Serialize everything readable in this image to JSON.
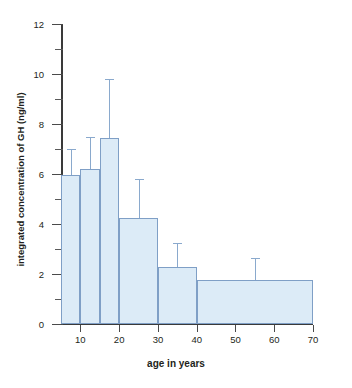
{
  "chart_data": {
    "type": "bar",
    "title": "",
    "xlabel": "age in years",
    "ylabel": "integrated concentration of GH (ng/ml)",
    "xlim": [
      5,
      70
    ],
    "ylim": [
      0,
      12
    ],
    "grid": false,
    "legend": null,
    "y_ticks": [
      0,
      2,
      4,
      6,
      8,
      10,
      12
    ],
    "y_tick_labels": [
      "0",
      "2",
      "4",
      "6",
      "8",
      "10",
      "12"
    ],
    "y_minor_ticks": [
      1,
      3,
      5,
      7,
      9,
      11
    ],
    "x_ticks": [
      10,
      20,
      30,
      40,
      50,
      60,
      70
    ],
    "x_tick_labels": [
      "10",
      "20",
      "30",
      "40",
      "50",
      "60",
      "70"
    ],
    "categories": [
      "5-10",
      "10-15",
      "15-20",
      "20-30",
      "30-40",
      "40-70"
    ],
    "values": [
      5.95,
      6.2,
      7.45,
      4.25,
      2.3,
      1.75
    ],
    "errors": [
      1.05,
      1.3,
      2.35,
      1.55,
      0.95,
      0.9
    ],
    "bars": [
      {
        "label": "5-10",
        "x_start": 5,
        "x_end": 10,
        "value": 5.95,
        "error_high": 7.0
      },
      {
        "label": "10-15",
        "x_start": 10,
        "x_end": 15,
        "value": 6.2,
        "error_high": 7.5
      },
      {
        "label": "15-20",
        "x_start": 15,
        "x_end": 20,
        "value": 7.45,
        "error_high": 9.8
      },
      {
        "label": "20-30",
        "x_start": 20,
        "x_end": 30,
        "value": 4.25,
        "error_high": 5.8
      },
      {
        "label": "30-40",
        "x_start": 30,
        "x_end": 40,
        "value": 2.3,
        "error_high": 3.25
      },
      {
        "label": "40-70",
        "x_start": 40,
        "x_end": 70,
        "value": 1.75,
        "error_high": 2.65
      }
    ],
    "colors": {
      "bar_fill": "#dcebf7",
      "bar_edge": "#7f9fc6",
      "error_bar": "#8aa9cd",
      "axis": "#3a3a3a"
    }
  }
}
